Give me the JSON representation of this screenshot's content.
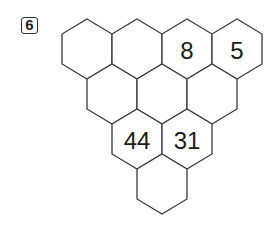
{
  "problem": {
    "number": "6"
  },
  "pyramid": {
    "rows": [
      {
        "cells": [
          {
            "value": ""
          },
          {
            "value": ""
          },
          {
            "value": "8"
          },
          {
            "value": "5"
          }
        ]
      },
      {
        "cells": [
          {
            "value": ""
          },
          {
            "value": ""
          },
          {
            "value": ""
          }
        ]
      },
      {
        "cells": [
          {
            "value": "44"
          },
          {
            "value": "31"
          }
        ]
      },
      {
        "cells": [
          {
            "value": ""
          }
        ]
      }
    ]
  },
  "style": {
    "stroke": "#3a3a3a",
    "text": "#1a1a1a"
  }
}
